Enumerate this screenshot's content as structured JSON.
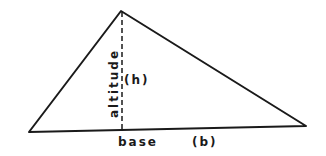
{
  "diagram": {
    "labels": {
      "altitude": "altitude",
      "height": "(h)",
      "base": "base",
      "base_var": "(b)"
    },
    "colors": {
      "stroke": "#1a1a1a",
      "background": "#ffffff"
    }
  }
}
